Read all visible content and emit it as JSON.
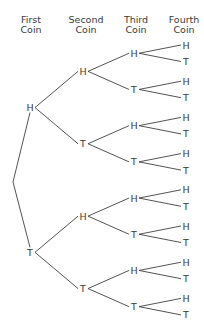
{
  "headers": [
    {
      "line1": "First",
      "line2": "Coin"
    },
    {
      "line1": "Second",
      "line2": "Coin"
    },
    {
      "line1": "Third",
      "line2": "Coin"
    },
    {
      "line1": "Fourth",
      "line2": "Coin"
    }
  ],
  "tree": {
    "outcomes": [
      "H",
      "T"
    ],
    "levels": 4,
    "first": [
      {
        "label": "H",
        "children": [
          {
            "label": "H",
            "children": [
              {
                "label": "H",
                "children": [
                  {
                    "label": "H"
                  },
                  {
                    "label": "T"
                  }
                ]
              },
              {
                "label": "T",
                "children": [
                  {
                    "label": "H"
                  },
                  {
                    "label": "T"
                  }
                ]
              }
            ]
          },
          {
            "label": "T",
            "children": [
              {
                "label": "H",
                "children": [
                  {
                    "label": "H"
                  },
                  {
                    "label": "T"
                  }
                ]
              },
              {
                "label": "T",
                "children": [
                  {
                    "label": "H"
                  },
                  {
                    "label": "T"
                  }
                ]
              }
            ]
          }
        ]
      },
      {
        "label": "T",
        "children": [
          {
            "label": "H",
            "children": [
              {
                "label": "H",
                "children": [
                  {
                    "label": "H"
                  },
                  {
                    "label": "T"
                  }
                ]
              },
              {
                "label": "T",
                "children": [
                  {
                    "label": "H"
                  },
                  {
                    "label": "T"
                  }
                ]
              }
            ]
          },
          {
            "label": "T",
            "children": [
              {
                "label": "H",
                "children": [
                  {
                    "label": "H"
                  },
                  {
                    "label": "T"
                  }
                ]
              },
              {
                "label": "T",
                "children": [
                  {
                    "label": "H"
                  },
                  {
                    "label": "T"
                  }
                ]
              }
            ]
          }
        ]
      }
    ]
  }
}
